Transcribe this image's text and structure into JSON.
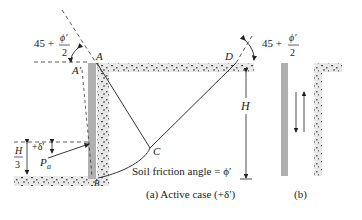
{
  "figure": {
    "part_a": {
      "caption": "(a)  Active case (+δ′)",
      "points": {
        "A": "A",
        "A_prime": "A′",
        "B": "B",
        "C": "C",
        "D": "D"
      },
      "angle_left": {
        "prefix": "45 +",
        "numerator": "ϕ′",
        "denominator": "2"
      },
      "angle_right": {
        "prefix": "45 +",
        "numerator": "ϕ′",
        "denominator": "2"
      },
      "height_label": "H",
      "third_height": {
        "numerator": "H",
        "denominator": "3"
      },
      "delta_label": "+δ′",
      "force_label": "P",
      "force_subscript": "a",
      "friction_text": "Soil friction angle = ϕ′"
    },
    "part_b": {
      "caption": "(b)"
    },
    "colors": {
      "wall": "#b0b0b0",
      "soil": "#e6e6e6",
      "soil_speckle": "#3a3a3a",
      "line": "#333333"
    }
  }
}
